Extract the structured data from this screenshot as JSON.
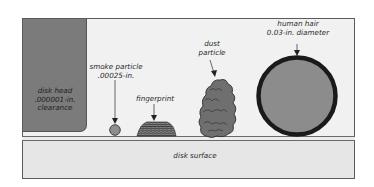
{
  "diagram": {
    "disk_head": {
      "lines": [
        "disk head",
        ".000001-in.",
        "clearance"
      ]
    },
    "smoke_particle": {
      "lines": [
        "smoke particle",
        ".00025-in."
      ]
    },
    "fingerprint": {
      "label": "fingerprint"
    },
    "dust_particle": {
      "lines": [
        "dust",
        "particle"
      ]
    },
    "human_hair": {
      "lines": [
        "human hair",
        "0.03-in. diameter"
      ]
    },
    "disk_surface": {
      "label": "disk surface"
    },
    "colors": {
      "frame_bg": "#f1f1f1",
      "disk_head": "#7b7b7b",
      "hair_fill": "#8a8a8a",
      "hair_ring": "#1a1a1a",
      "surface": "#e6e6e6"
    }
  }
}
